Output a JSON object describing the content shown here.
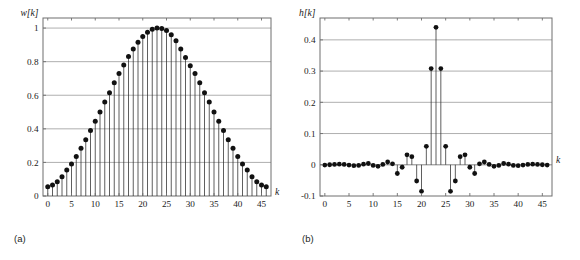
{
  "figure": {
    "panel_a_caption": "(a)",
    "panel_b_caption": "(b)"
  },
  "chart_data": [
    {
      "id": "panel-a",
      "type": "scatter",
      "plot_style": "stem",
      "title": "",
      "subtitle": "",
      "xlabel": "k",
      "ylabel": "w[k]",
      "xlim": [
        -1,
        47
      ],
      "ylim": [
        0,
        1.06
      ],
      "xticks": [
        0,
        5,
        10,
        15,
        20,
        25,
        30,
        35,
        40,
        45
      ],
      "xticklabels": [
        "0",
        "5",
        "10",
        "15",
        "20",
        "25",
        "30",
        "35",
        "40",
        "45"
      ],
      "yticks": [
        0,
        0.2,
        0.4,
        0.6,
        0.8,
        1
      ],
      "yticklabels": [
        "0",
        "0.2",
        "0.4",
        "0.6",
        "0.8",
        "1"
      ],
      "grid": "horizontal",
      "legend": "none",
      "annotations": [
        "(a)"
      ],
      "x": [
        0,
        1,
        2,
        3,
        4,
        5,
        6,
        7,
        8,
        9,
        10,
        11,
        12,
        13,
        14,
        15,
        16,
        17,
        18,
        19,
        20,
        21,
        22,
        23,
        24,
        25,
        26,
        27,
        28,
        29,
        30,
        31,
        32,
        33,
        34,
        35,
        36,
        37,
        38,
        39,
        40,
        41,
        42,
        43,
        44,
        45,
        46
      ],
      "values": [
        0.055,
        0.065,
        0.085,
        0.115,
        0.155,
        0.19,
        0.235,
        0.285,
        0.335,
        0.39,
        0.445,
        0.5,
        0.56,
        0.615,
        0.675,
        0.73,
        0.78,
        0.83,
        0.875,
        0.915,
        0.95,
        0.975,
        0.993,
        1.0,
        0.998,
        0.985,
        0.96,
        0.925,
        0.875,
        0.825,
        0.775,
        0.73,
        0.675,
        0.615,
        0.56,
        0.5,
        0.445,
        0.39,
        0.335,
        0.285,
        0.235,
        0.19,
        0.155,
        0.115,
        0.085,
        0.065,
        0.055
      ]
    },
    {
      "id": "panel-b",
      "type": "scatter",
      "plot_style": "stem",
      "title": "",
      "subtitle": "",
      "xlabel": "k",
      "ylabel": "h[k]",
      "xlim": [
        -1,
        47
      ],
      "ylim": [
        -0.1,
        0.47
      ],
      "xticks": [
        0,
        5,
        10,
        15,
        20,
        25,
        30,
        35,
        40,
        45
      ],
      "xticklabels": [
        "0",
        "5",
        "10",
        "15",
        "20",
        "25",
        "30",
        "35",
        "40",
        "45"
      ],
      "yticks": [
        -0.1,
        0,
        0.1,
        0.2,
        0.3,
        0.4
      ],
      "yticklabels": [
        "-0.1",
        "0",
        "0.1",
        "0.2",
        "0.3",
        "0.4"
      ],
      "grid": "horizontal",
      "legend": "none",
      "annotations": [
        "(b)"
      ],
      "x": [
        0,
        1,
        2,
        3,
        4,
        5,
        6,
        7,
        8,
        9,
        10,
        11,
        12,
        13,
        14,
        15,
        16,
        17,
        18,
        19,
        20,
        21,
        22,
        23,
        24,
        25,
        26,
        27,
        28,
        29,
        30,
        31,
        32,
        33,
        34,
        35,
        36,
        37,
        38,
        39,
        40,
        41,
        42,
        43,
        44,
        45,
        46
      ],
      "values": [
        -0.001,
        0.0,
        0.001,
        0.002,
        0.001,
        -0.001,
        -0.003,
        -0.002,
        0.002,
        0.004,
        -0.002,
        -0.005,
        0.001,
        0.009,
        0.003,
        -0.028,
        -0.008,
        0.032,
        0.026,
        -0.052,
        -0.085,
        0.059,
        0.308,
        0.44,
        0.308,
        0.059,
        -0.085,
        -0.052,
        0.026,
        0.032,
        -0.008,
        -0.028,
        0.003,
        0.009,
        0.001,
        -0.005,
        -0.002,
        0.004,
        0.002,
        -0.002,
        -0.003,
        -0.001,
        0.001,
        0.002,
        0.001,
        0.0,
        -0.001
      ]
    }
  ]
}
